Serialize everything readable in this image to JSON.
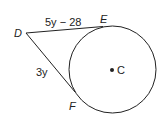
{
  "diagram": {
    "type": "circle-tangents",
    "points": {
      "D": {
        "label": "D"
      },
      "E": {
        "label": "E"
      },
      "F": {
        "label": "F"
      },
      "C": {
        "label": "C"
      }
    },
    "segments": {
      "DE": {
        "label": "5y − 28"
      },
      "DF": {
        "label": "3y"
      }
    },
    "stroke_color": "#222222"
  }
}
